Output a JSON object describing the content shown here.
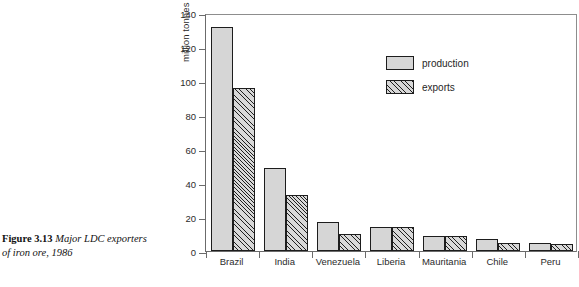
{
  "caption": {
    "figure_number": "Figure 3.13",
    "text": "Major LDC exporters of iron ore, 1986"
  },
  "top_crop_text": "",
  "legend": {
    "items": [
      {
        "label": "production",
        "key": "production",
        "style": "solid-gray"
      },
      {
        "label": "exports",
        "key": "exports",
        "style": "hatched"
      }
    ]
  },
  "colors": {
    "production_fill": "#d6d6d6",
    "exports_fill": "#d8d8d8",
    "bar_outline": "#1d1d1d",
    "axis": "#6b6b6b",
    "frame": "#8d8d8d",
    "text": "#2b2b2b"
  },
  "chart_data": {
    "type": "bar",
    "title": "",
    "subtitle": "",
    "xlabel": "",
    "ylabel": "million tonnes of raw iron ore",
    "categories": [
      "Brazil",
      "India",
      "Venezuela",
      "Liberia",
      "Mauritania",
      "Chile",
      "Peru"
    ],
    "series": [
      {
        "name": "production",
        "values": [
          132,
          49,
          17,
          14,
          9,
          7,
          5
        ]
      },
      {
        "name": "exports",
        "values": [
          96,
          33,
          10,
          14,
          9,
          5,
          4
        ]
      }
    ],
    "ylim": [
      0,
      140
    ],
    "yticks": [
      0,
      20,
      40,
      60,
      80,
      100,
      120,
      140
    ],
    "ytick_labels": [
      "0",
      "20",
      "40",
      "60",
      "80",
      "100",
      "120",
      "140"
    ],
    "grid": false,
    "legend_position": "inside-upper-center",
    "legend_entries": [
      "production",
      "exports"
    ]
  }
}
